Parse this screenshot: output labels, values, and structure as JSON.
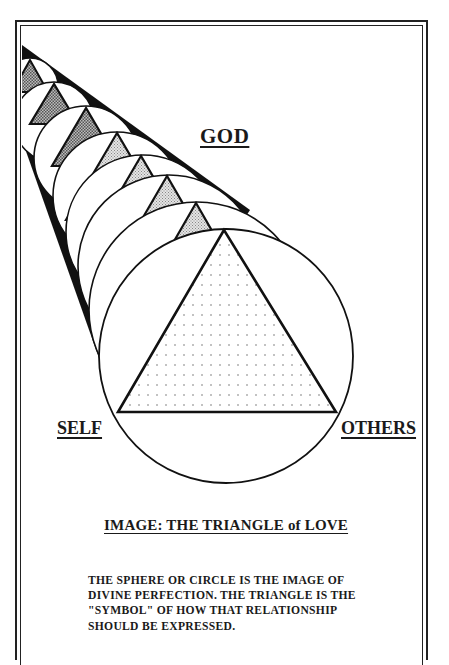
{
  "labels": {
    "top": "GOD",
    "left": "SELF",
    "right": "OTHERS"
  },
  "caption": "IMAGE: THE TRIANGLE of LOVE",
  "description": {
    "lines": [
      "THE SPHERE OR CIRCLE IS THE IMAGE OF",
      "DIVINE PERFECTION. THE TRIANGLE IS THE",
      "\"SYMBOL\"  OF HOW THAT RELATIONSHIP",
      "SHOULD BE EXPRESSED."
    ]
  },
  "colors": {
    "ink": "#1a1a1a",
    "paper": "#ffffff",
    "shade_dark": "#8a8a8a",
    "shade_light": "#d6d6d6"
  }
}
